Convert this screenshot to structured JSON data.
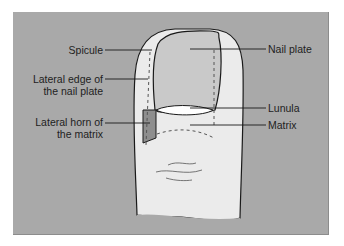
{
  "diagram": {
    "colors": {
      "background_panel": "#a9a9a9",
      "finger_skin": "#ebebeb",
      "nail_plate": "#c9c9c9",
      "lunula": "#ffffff",
      "lateral_horn": "#8e8e8e",
      "outline": "#1a1a1a"
    },
    "labels_left": [
      {
        "id": "spicule",
        "line1": "Spicule",
        "line2": ""
      },
      {
        "id": "lateral-edge",
        "line1": "Lateral edge of",
        "line2": "the nail plate"
      },
      {
        "id": "lateral-horn",
        "line1": "Lateral horn of",
        "line2": "the matrix"
      }
    ],
    "labels_right": [
      {
        "id": "nail-plate",
        "text": "Nail plate"
      },
      {
        "id": "lunula",
        "text": "Lunula"
      },
      {
        "id": "matrix",
        "text": "Matrix"
      }
    ]
  }
}
